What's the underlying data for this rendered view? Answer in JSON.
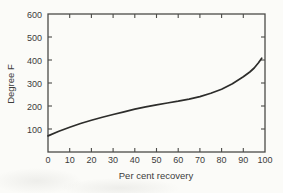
{
  "figure": {
    "background": "#fbfbf8",
    "axis_color": "#4b4b48",
    "text_color": "#3c3c3c"
  },
  "chart_data": {
    "type": "line",
    "title": "",
    "xlabel": "Per cent recovery",
    "ylabel": "Degree F",
    "xlim": [
      0,
      100
    ],
    "ylim": [
      0,
      600
    ],
    "x_ticks": [
      0,
      10,
      20,
      30,
      40,
      50,
      60,
      70,
      80,
      90,
      100
    ],
    "y_ticks": [
      100,
      200,
      300,
      400,
      500,
      600
    ],
    "grid": false,
    "frame": "closed box with inward tick marks on all four sides",
    "legend": "none",
    "line_color": "#2d2d2b",
    "series": [
      {
        "name": "distillation-curve",
        "points": [
          [
            0,
            70
          ],
          [
            5,
            90
          ],
          [
            10,
            108
          ],
          [
            15,
            124
          ],
          [
            20,
            138
          ],
          [
            25,
            151
          ],
          [
            30,
            163
          ],
          [
            35,
            175
          ],
          [
            40,
            186
          ],
          [
            45,
            196
          ],
          [
            50,
            205
          ],
          [
            55,
            213
          ],
          [
            60,
            221
          ],
          [
            65,
            230
          ],
          [
            70,
            241
          ],
          [
            75,
            255
          ],
          [
            80,
            273
          ],
          [
            85,
            297
          ],
          [
            90,
            327
          ],
          [
            93,
            348
          ],
          [
            95,
            365
          ],
          [
            97,
            388
          ],
          [
            98.5,
            408
          ]
        ]
      }
    ]
  }
}
